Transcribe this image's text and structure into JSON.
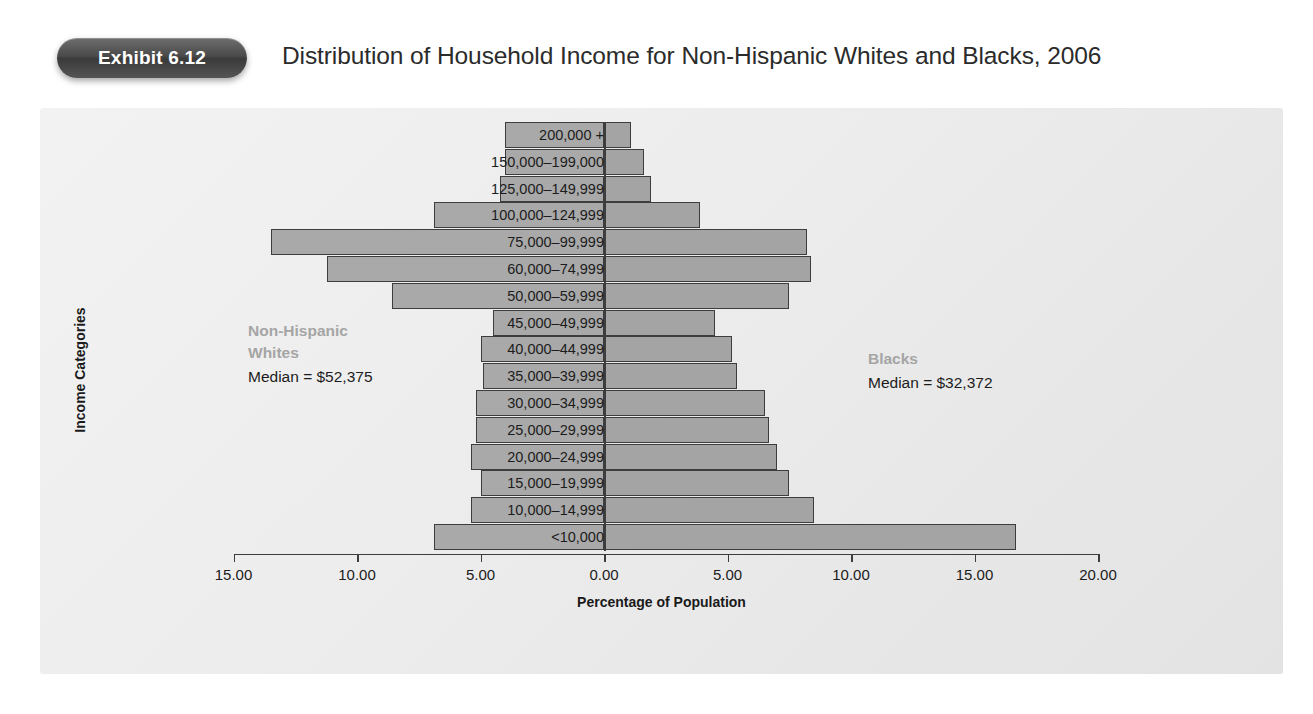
{
  "header": {
    "badge_label": "Exhibit 6.12",
    "title": "Distribution of Household Income for Non-Hispanic Whites and Blacks, 2006"
  },
  "annotations": {
    "left": {
      "group_line1": "Non-Hispanic",
      "group_line2": "Whites",
      "median": "Median = $52,375"
    },
    "right": {
      "group_line1": "Blacks",
      "median": "Median = $32,372"
    }
  },
  "colors": {
    "bar_fill": "#a8a8a8",
    "bar_stroke": "#3d3d3d",
    "panel_bg": "#eeeeee",
    "badge_bg": "#4a4a4a",
    "annot_group": "#a5a5a5",
    "text": "#1c1c1c"
  },
  "chart_data": {
    "type": "bar",
    "subtype": "population-pyramid",
    "title": "Distribution of Household Income for Non-Hispanic Whites and Blacks, 2006",
    "xlabel": "Percentage of Population",
    "ylabel": "Income Categories",
    "xlim": [
      -15.0,
      20.0
    ],
    "xticks": [
      -15.0,
      -10.0,
      -5.0,
      0.0,
      5.0,
      10.0,
      15.0,
      20.0
    ],
    "xtick_labels": [
      "15.00",
      "10.00",
      "5.00",
      "0.00",
      "5.00",
      "10.00",
      "15.00",
      "20.00"
    ],
    "grid": false,
    "legend_position": "inline-annotation",
    "categories": [
      "200,000 +",
      "150,000–199,000",
      "125,000–149,999",
      "100,000–124,999",
      "75,000–99,999",
      "60,000–74,999",
      "50,000–59,999",
      "45,000–49,999",
      "40,000–44,999",
      "35,000–39,999",
      "30,000–34,999",
      "25,000–29,999",
      "20,000–24,999",
      "15,000–19,999",
      "10,000–14,999",
      "<10,000"
    ],
    "series": [
      {
        "name": "Non-Hispanic Whites",
        "side": "left",
        "median": 52375,
        "values": [
          4.0,
          4.0,
          4.2,
          6.9,
          13.5,
          11.2,
          8.6,
          4.5,
          5.0,
          4.9,
          5.2,
          5.2,
          5.4,
          5.0,
          5.4,
          6.9
        ]
      },
      {
        "name": "Blacks",
        "side": "right",
        "median": 32372,
        "values": [
          1.1,
          1.6,
          1.9,
          3.9,
          8.2,
          8.4,
          7.5,
          4.5,
          5.2,
          5.4,
          6.5,
          6.7,
          7.0,
          7.5,
          8.5,
          16.7
        ]
      }
    ]
  }
}
